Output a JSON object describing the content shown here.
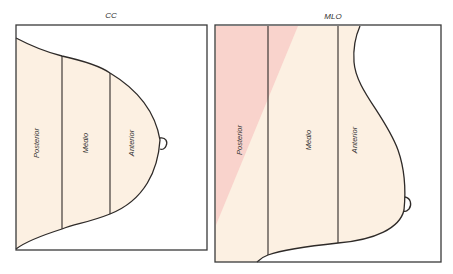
{
  "diagram": {
    "panels": [
      {
        "id": "cc",
        "title": "CC",
        "zones": [
          "Posterior",
          "Médio",
          "Anterior"
        ]
      },
      {
        "id": "mlo",
        "title": "MLO",
        "zones": [
          "Posterior",
          "Médio",
          "Anterior"
        ]
      }
    ],
    "colors": {
      "breast_fill": "#fcf0e2",
      "highlight_fill": "#f9d3cc",
      "outline": "#2e2a28",
      "frame": "#3a3a3a"
    }
  }
}
